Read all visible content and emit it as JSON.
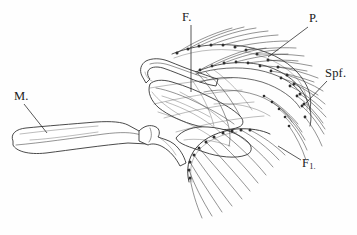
{
  "figure": {
    "kind": "anatomical-line-drawing",
    "background_color": "#fefefe",
    "ink_color": "#2b2b2b",
    "width": 357,
    "height": 235
  },
  "labels": [
    {
      "id": "m",
      "text": "M.",
      "x": 14,
      "y": 89,
      "leader": {
        "x1": 24,
        "y1": 104,
        "x2": 47,
        "y2": 133
      }
    },
    {
      "id": "f",
      "text": "F.",
      "x": 182,
      "y": 10,
      "leader": {
        "x1": 191,
        "y1": 25,
        "x2": 191,
        "y2": 92
      }
    },
    {
      "id": "p",
      "text": "P.",
      "x": 309,
      "y": 11,
      "leader": {
        "x1": 308,
        "y1": 27,
        "x2": 268,
        "y2": 57
      }
    },
    {
      "id": "spf",
      "text": "Spf.",
      "x": 325,
      "y": 66,
      "leader": {
        "x1": 327,
        "y1": 81,
        "x2": 306,
        "y2": 103
      }
    },
    {
      "id": "f1",
      "text": "F",
      "subscript": "1.",
      "x": 302,
      "y": 156,
      "leader": {
        "x1": 301,
        "y1": 160,
        "x2": 278,
        "y2": 146
      }
    }
  ],
  "label_names": {
    "m": "mandible-plate-label",
    "f": "first-arch-label",
    "p": "palatine-label",
    "spf": "spine-field-label",
    "f1": "first-branchial-filament-label"
  }
}
